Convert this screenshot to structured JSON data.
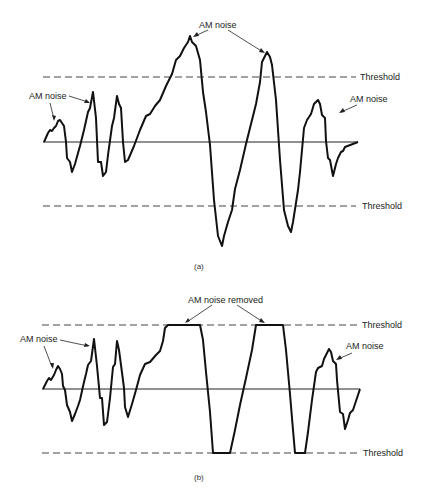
{
  "panels": [
    {
      "id": "a",
      "caption": "(a)",
      "threshold_upper_label": "Threshold",
      "threshold_lower_label": "Threshold",
      "annotations": [
        {
          "text": "AM noise",
          "position": "left"
        },
        {
          "text": "AM noise",
          "position": "top"
        },
        {
          "text": "AM noise",
          "position": "right"
        }
      ],
      "description": "FM waveform with amplitude (AM) noise exceeding thresholds"
    },
    {
      "id": "b",
      "caption": "(b)",
      "threshold_upper_label": "Threshold",
      "threshold_lower_label": "Threshold",
      "annotations": [
        {
          "text": "AM noise",
          "position": "left"
        },
        {
          "text": "AM noise removed",
          "position": "top"
        },
        {
          "text": "AM noise",
          "position": "right"
        }
      ],
      "description": "Same waveform clipped at thresholds, AM noise removed on peaks"
    }
  ]
}
